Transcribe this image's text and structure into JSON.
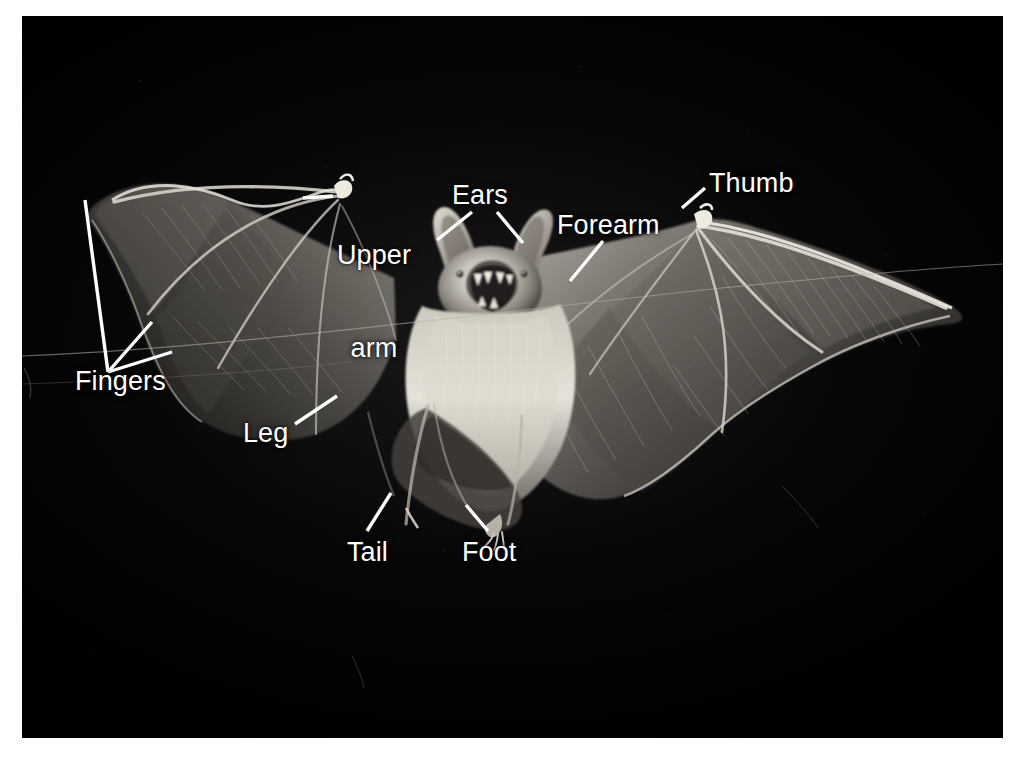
{
  "figure": {
    "kind": "anatomical-photograph",
    "background_color": "#030303",
    "page_color": "#ffffff",
    "label_color": "#ffffff",
    "leader_line_color": "#ffffff"
  },
  "labels": {
    "upper_arm_line1": "Upper",
    "upper_arm_line2": "arm",
    "ears": "Ears",
    "thumb": "Thumb",
    "forearm": "Forearm",
    "fingers": "Fingers",
    "leg": "Leg",
    "tail": "Tail",
    "foot": "Foot"
  },
  "label_positions": {
    "upper_arm": {
      "x": 337,
      "y": 178
    },
    "ears": {
      "x": 452,
      "y": 180
    },
    "thumb": {
      "x": 709,
      "y": 168
    },
    "forearm": {
      "x": 557,
      "y": 210
    },
    "fingers": {
      "x": 75,
      "y": 366
    },
    "leg": {
      "x": 243,
      "y": 418
    },
    "tail": {
      "x": 347,
      "y": 537
    },
    "foot": {
      "x": 462,
      "y": 537
    }
  },
  "anatomy_parts": [
    "Upper arm",
    "Ears",
    "Thumb",
    "Forearm",
    "Fingers",
    "Leg",
    "Tail",
    "Foot"
  ]
}
